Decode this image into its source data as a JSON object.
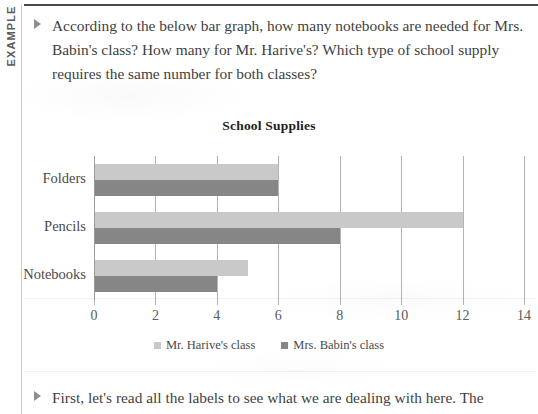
{
  "rail": {
    "label": "EXAMPLE"
  },
  "question": {
    "text": "According to the below bar graph, how many notebooks are needed for Mrs. Babin's class? How many for Mr. Harive's? Which type of school supply requires the same number for both classes?"
  },
  "footer": {
    "text": "First, let's read all the labels to see what we are dealing with here. The"
  },
  "colors": {
    "series_light": "#c9c9c9",
    "series_dark": "#868686",
    "gridline": "#b4b4b4",
    "text": "#4a4a4a"
  },
  "chart_data": {
    "type": "bar",
    "orientation": "horizontal",
    "title": "School Supplies",
    "xlabel": "",
    "ylabel": "",
    "categories": [
      "Folders",
      "Pencils",
      "Notebooks"
    ],
    "series": [
      {
        "name": "Mr. Harive's class",
        "values": [
          6,
          12,
          5
        ],
        "color": "#c9c9c9"
      },
      {
        "name": "Mrs. Babin's class",
        "values": [
          6,
          8,
          4
        ],
        "color": "#868686"
      }
    ],
    "xlim": [
      0,
      14
    ],
    "xticks": [
      0,
      2,
      4,
      6,
      8,
      10,
      12,
      14
    ],
    "xtick_labels": [
      "0",
      "2",
      "4",
      "6",
      "8",
      "10",
      "12",
      "14"
    ],
    "grid": true,
    "legend_position": "bottom"
  }
}
